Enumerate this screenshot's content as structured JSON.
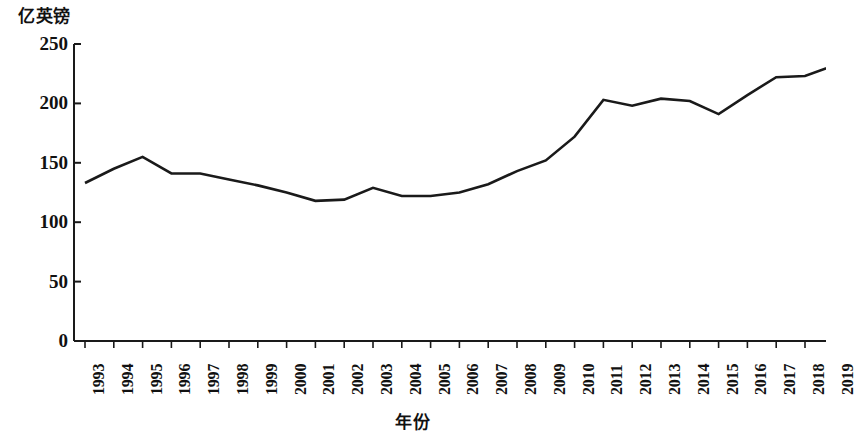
{
  "chart_data": {
    "type": "line",
    "title": "",
    "ylabel": "亿英镑",
    "xlabel": "年份",
    "x": [
      1993,
      1994,
      1995,
      1996,
      1997,
      1998,
      1999,
      2000,
      2001,
      2002,
      2003,
      2004,
      2005,
      2006,
      2007,
      2008,
      2009,
      2010,
      2011,
      2012,
      2013,
      2014,
      2015,
      2016,
      2017,
      2018,
      2019
    ],
    "categories": [
      "1993",
      "1994",
      "1995",
      "1996",
      "1997",
      "1998",
      "1999",
      "2000",
      "2001",
      "2002",
      "2003",
      "2004",
      "2005",
      "2006",
      "2007",
      "2008",
      "2009",
      "2010",
      "2011",
      "2012",
      "2013",
      "2014",
      "2015",
      "2016",
      "2017",
      "2018",
      "2019"
    ],
    "values": [
      133,
      145,
      155,
      141,
      141,
      136,
      131,
      125,
      118,
      119,
      129,
      122,
      122,
      125,
      132,
      143,
      152,
      172,
      203,
      198,
      204,
      202,
      191,
      207,
      222,
      223,
      232
    ],
    "series": [
      {
        "name": "",
        "values": [
          133,
          145,
          155,
          141,
          141,
          136,
          131,
          125,
          118,
          119,
          129,
          122,
          122,
          125,
          132,
          143,
          152,
          172,
          203,
          198,
          204,
          202,
          191,
          207,
          222,
          223,
          232
        ]
      }
    ],
    "ylim": [
      0,
      250
    ],
    "y_ticks": [
      0,
      50,
      100,
      150,
      200,
      250
    ],
    "y_tick_labels": [
      "0",
      "50",
      "100",
      "150",
      "200",
      "250"
    ],
    "grid": false,
    "legend": false,
    "line_color": "#1a1a1a",
    "axis_color": "#1a1a1a"
  }
}
